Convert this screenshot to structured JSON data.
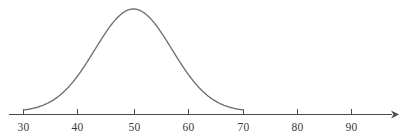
{
  "chart_data": {
    "type": "line",
    "title": "",
    "subtitle": "",
    "xlabel": "",
    "ylabel": "",
    "grid": false,
    "legend": null,
    "legend_position": "none",
    "curve": {
      "name": "normal-distribution",
      "distribution": "normal",
      "mean": 50,
      "std_dev": 7,
      "peak_x": 50,
      "x_start": 30,
      "x_end": 70,
      "color": "#6f6f6f",
      "x": [
        30,
        32,
        34,
        36,
        38,
        40,
        42,
        44,
        46,
        48,
        50,
        52,
        54,
        56,
        58,
        60,
        62,
        64,
        66,
        68,
        70
      ],
      "y": [
        0.02,
        0.04,
        0.07,
        0.12,
        0.2,
        0.31,
        0.45,
        0.6,
        0.76,
        0.91,
        1.0,
        0.91,
        0.76,
        0.6,
        0.45,
        0.31,
        0.2,
        0.12,
        0.07,
        0.04,
        0.02
      ]
    },
    "axis": {
      "orientation": "horizontal",
      "has_arrow": true,
      "arrow_direction": "right",
      "xlim": [
        25.6,
        97.2
      ],
      "ticks": [
        30,
        40,
        50,
        60,
        70,
        80,
        90
      ],
      "tick_labels": [
        "30",
        "40",
        "50",
        "60",
        "70",
        "80",
        "90"
      ],
      "color": "#4a4a4a"
    }
  },
  "figure": {
    "background_color": "#ffffff",
    "width": 405,
    "height": 139
  }
}
